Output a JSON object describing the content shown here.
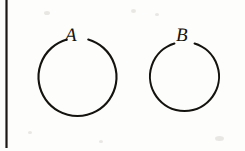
{
  "figure": {
    "kind": "line-diagram",
    "width": 245,
    "height": 151,
    "background_color": "#fdfdfb",
    "ink_color": "#15130f",
    "stroke_width": 2.1
  },
  "margin_rule": {
    "name": "left-vertical-rule",
    "x": 6.5,
    "y_start": 0,
    "y_end": 148,
    "thickness": 2.2,
    "color": "#1a1714"
  },
  "shapes": [
    {
      "id": "circle-a",
      "label": "A",
      "center_x": 77.5,
      "center_y": 77.0,
      "radius": 39.0,
      "gap_start_deg": -106,
      "gap_end_deg": -74,
      "label_x": 65,
      "label_y": 26,
      "label_font_size": 19
    },
    {
      "id": "circle-b",
      "label": "B",
      "center_x": 184.5,
      "center_y": 76.5,
      "radius": 34.5,
      "gap_start_deg": -107,
      "gap_end_deg": -73,
      "label_x": 176,
      "label_y": 26,
      "label_font_size": 19
    }
  ],
  "specks": [
    {
      "x": 215,
      "y": 136,
      "w": 9,
      "h": 5
    },
    {
      "x": 44,
      "y": 11,
      "w": 6,
      "h": 4
    },
    {
      "x": 131,
      "y": 9,
      "w": 5,
      "h": 4
    },
    {
      "x": 155,
      "y": 13,
      "w": 4,
      "h": 3
    },
    {
      "x": 99,
      "y": 140,
      "w": 4,
      "h": 3
    },
    {
      "x": 28,
      "y": 131,
      "w": 4,
      "h": 3
    }
  ]
}
